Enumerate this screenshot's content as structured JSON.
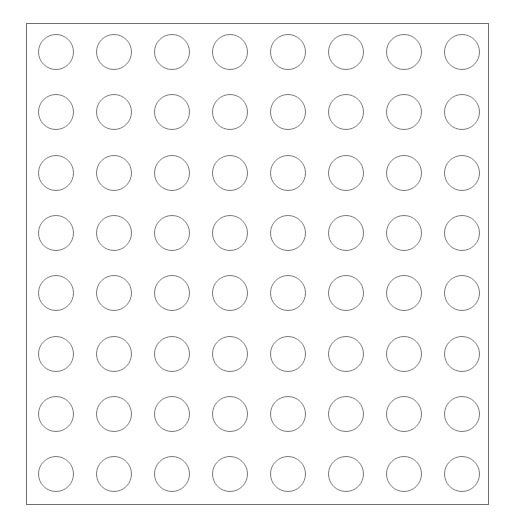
{
  "diagram": {
    "type": "circle-grid",
    "rows": 8,
    "columns": 8,
    "colors": {
      "background": "#ffffff",
      "frame_stroke": "#6f6f6f",
      "circle_stroke": "#7a7a7a"
    },
    "circle_diameter": 36,
    "first_center": [
      56,
      52
    ],
    "column_spacing": 58,
    "row_spacing": 60.3
  }
}
